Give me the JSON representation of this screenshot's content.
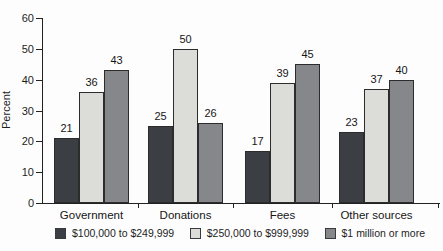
{
  "chart_data": {
    "type": "bar",
    "title": "",
    "xlabel": "",
    "ylabel": "Percent",
    "ylim": [
      0,
      60
    ],
    "yticks": [
      0,
      10,
      20,
      30,
      40,
      50,
      60
    ],
    "grid": false,
    "value_labels": true,
    "legend_position": "bottom",
    "categories": [
      "Government",
      "Donations",
      "Fees",
      "Other sources"
    ],
    "series": [
      {
        "name": "$100,000 to $249,999",
        "color": "#3b3e43",
        "values": [
          21,
          25,
          17,
          23
        ]
      },
      {
        "name": "$250,000 to $999,999",
        "color": "#dcddd8",
        "values": [
          36,
          50,
          39,
          37
        ]
      },
      {
        "name": "$1 million or more",
        "color": "#85878a",
        "values": [
          43,
          26,
          45,
          40
        ]
      }
    ],
    "colors": {
      "axis": "#222222",
      "text": "#1d1d1d",
      "background": "#fdfdfd"
    }
  }
}
